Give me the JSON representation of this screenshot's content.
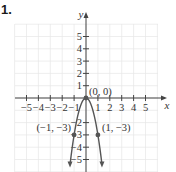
{
  "problem": {
    "number": "1."
  },
  "chart_data": {
    "type": "line",
    "title": "",
    "function": "y = -3x^2",
    "xlabel": "x",
    "ylabel": "y",
    "xlim": [
      -5,
      5
    ],
    "ylim": [
      -5,
      5
    ],
    "grid": true,
    "x_ticks": [
      "-5",
      "-4",
      "-3",
      "-2",
      "-1",
      "1",
      "2",
      "3",
      "4",
      "5"
    ],
    "y_ticks": [
      "5",
      "4",
      "3",
      "2",
      "1",
      "-2",
      "-3",
      "-4",
      "-5"
    ],
    "points": [
      {
        "x": 0,
        "y": 0,
        "label": "(0, 0)"
      },
      {
        "x": -1,
        "y": -3,
        "label": "(−1, −3)"
      },
      {
        "x": 1,
        "y": -3,
        "label": "(1, −3)"
      }
    ],
    "colors": {
      "curve": "#555555",
      "axis": "#444444",
      "grid": "#e6e6e6"
    }
  }
}
